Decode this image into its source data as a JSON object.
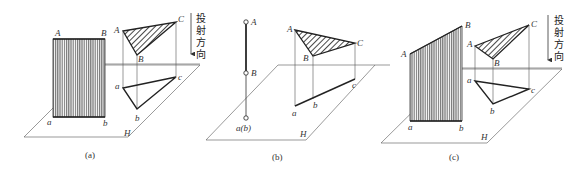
{
  "figure": {
    "panels": [
      {
        "caption": "(a)",
        "plane_label": "H",
        "direction_text": [
          "投",
          "射",
          "方",
          "向"
        ],
        "rect_labels": {
          "A": "A",
          "B": "B",
          "a": "a",
          "b": "b"
        },
        "tri_labels": {
          "A": "A",
          "B": "B",
          "C": "C",
          "a": "a",
          "b": "b",
          "c": "c"
        }
      },
      {
        "caption": "(b)",
        "plane_label": "H",
        "direction_text": [
          "投",
          "射",
          "方",
          "向"
        ],
        "line_labels": {
          "A": "A",
          "B": "B",
          "ab": "a(b)"
        },
        "tri_labels": {
          "A": "A",
          "B": "B",
          "C": "C",
          "a": "a",
          "b": "b",
          "c": "c"
        }
      },
      {
        "caption": "(c)",
        "plane_label": "H",
        "direction_text": [
          "投",
          "射",
          "方",
          "向"
        ],
        "rect_labels": {
          "A": "A",
          "B": "B",
          "a": "a",
          "b": "b"
        },
        "tri_labels": {
          "A": "A",
          "B": "B",
          "C": "C",
          "a": "a",
          "b": "b",
          "c": "c"
        }
      }
    ]
  }
}
